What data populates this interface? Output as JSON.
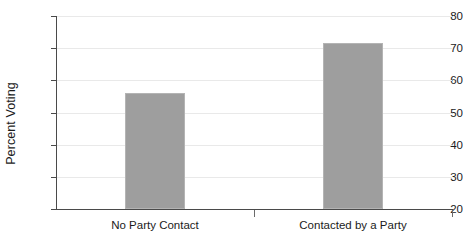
{
  "chart_data": {
    "type": "bar",
    "title": "",
    "xlabel": "",
    "ylabel": "Percent Voting",
    "categories": [
      "No Party Contact",
      "Contacted by a Party"
    ],
    "values": [
      56,
      71.5
    ],
    "ylim": [
      20,
      80
    ],
    "yticks": [
      20,
      30,
      40,
      50,
      60,
      70,
      80
    ],
    "ytick_labels": [
      "20",
      "30",
      "40",
      "50",
      "60",
      "70",
      "80"
    ],
    "grid": true,
    "legend": null,
    "series": [
      {
        "name": "Percent Voting",
        "values": [
          56,
          71.5
        ],
        "color": "#9e9e9e"
      }
    ],
    "colors": {
      "bar_fill": "#9e9e9e",
      "bar_edge": "#b4b4b4",
      "gridline": "#e9e9e9",
      "axis": "#4a4a4a",
      "text": "#1b1b1b",
      "background": "#ffffff"
    }
  }
}
